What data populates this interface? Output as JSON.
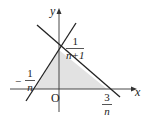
{
  "diagram": {
    "type": "coordinate-plane-region",
    "axes": {
      "x_label": "x",
      "y_label": "y",
      "origin_label": "O"
    },
    "lines": [
      {
        "name": "line-positive-slope",
        "description": "passes through (-1/n, 0) and (0, 1/(n+1))"
      },
      {
        "name": "line-negative-slope",
        "description": "passes through (0, 1/(n+1)) and (3/n, 0)"
      }
    ],
    "shaded_region": {
      "vertices": [
        "(-1/n, 0)",
        "(0, 1/(n+1))",
        "(3/n, 0)"
      ],
      "fill_color": "#e2e2e2"
    },
    "labels": {
      "y_intercept": {
        "numerator": "1",
        "denominator": "n+1"
      },
      "left_x_intercept": {
        "sign": "−",
        "numerator": "1",
        "denominator": "n"
      },
      "right_x_intercept": {
        "numerator": "3",
        "denominator": "n"
      }
    },
    "colors": {
      "line": "#222222",
      "axis": "#333333",
      "shade": "#e2e2e2"
    }
  }
}
